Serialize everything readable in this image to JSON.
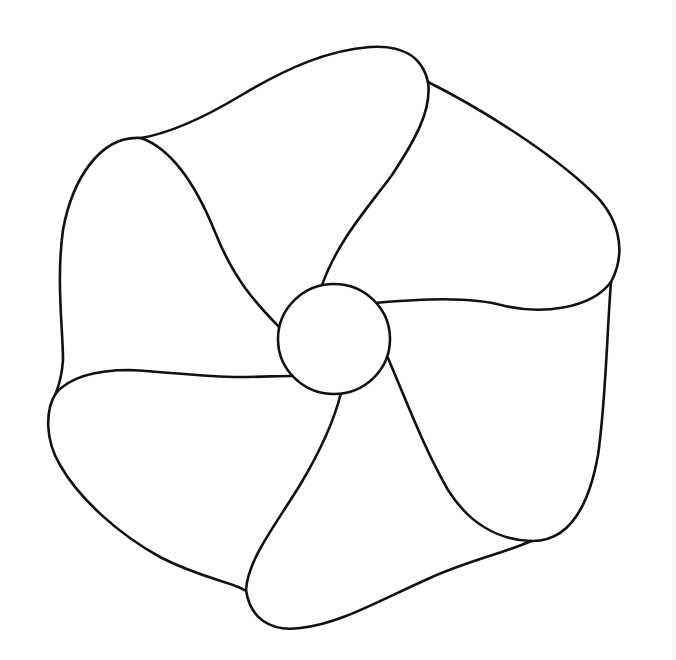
{
  "drawing": {
    "subject": "pinwheel line art",
    "background_color": "#ffffff",
    "line_color": "#111111",
    "blade_count": 6,
    "hub": {
      "cx": 334,
      "cy": 339,
      "rx": 56,
      "ry": 55
    },
    "blades": [
      {
        "name": "top",
        "outer_corner": [
          428,
          82
        ]
      },
      {
        "name": "upper-left",
        "outer_corner": [
          141,
          138
        ]
      },
      {
        "name": "left",
        "outer_corner": [
          56,
          393
        ]
      },
      {
        "name": "bottom",
        "outer_corner": [
          244,
          590
        ]
      },
      {
        "name": "lower-right",
        "outer_corner": [
          531,
          541
        ]
      },
      {
        "name": "upper-right",
        "outer_corner": [
          611,
          282
        ]
      }
    ]
  },
  "caption": ""
}
